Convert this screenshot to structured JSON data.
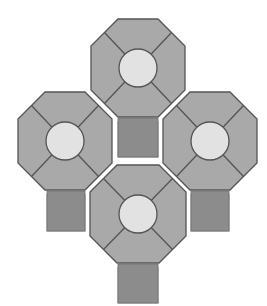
{
  "diagram": {
    "colors": {
      "background": "#ffffff",
      "octagon_fill": "#a9a9a9",
      "outline": "#555555",
      "circle_fill": "#e2e2e2",
      "stem_fill": "#8c8c8c",
      "gap": "#ffffff"
    },
    "units": [
      {
        "id": "top",
        "cx": 138,
        "cy": 68,
        "w": 94,
        "h": 98,
        "cut": 27,
        "r": 19,
        "stem": {
          "x": 118,
          "y": 117,
          "w": 40,
          "h": 40
        }
      },
      {
        "id": "left",
        "cx": 65,
        "cy": 141,
        "w": 94,
        "h": 98,
        "cut": 27,
        "r": 19,
        "stem": {
          "x": 47,
          "y": 190,
          "w": 38,
          "h": 41
        }
      },
      {
        "id": "right",
        "cx": 210,
        "cy": 141,
        "w": 94,
        "h": 98,
        "cut": 27,
        "r": 19,
        "stem": {
          "x": 191,
          "y": 190,
          "w": 38,
          "h": 41
        }
      },
      {
        "id": "bottom",
        "cx": 138,
        "cy": 214,
        "w": 96,
        "h": 98,
        "cut": 27,
        "r": 19,
        "stem": {
          "x": 118,
          "y": 263,
          "w": 40,
          "h": 40
        }
      }
    ]
  }
}
